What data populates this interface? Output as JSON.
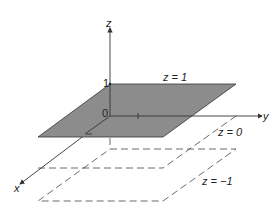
{
  "diagram": {
    "axes": {
      "x_label": "x",
      "y_label": "y",
      "z_label": "z"
    },
    "ticks": {
      "z_one": "1",
      "origin": "0"
    },
    "planes": [
      {
        "label": "z = 1",
        "style": "filled",
        "color": "#8c8c8c"
      },
      {
        "label": "z = 0",
        "style": "dashed"
      },
      {
        "label": "z = −1",
        "style": "dashed"
      }
    ]
  }
}
